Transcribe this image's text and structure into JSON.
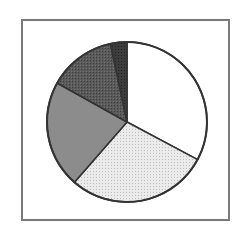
{
  "chart_data": {
    "type": "pie",
    "title": "",
    "categories": [
      "Slice 1",
      "Slice 2",
      "Slice 3",
      "Slice 4",
      "Slice 5"
    ],
    "values": [
      32.8,
      28.6,
      21.7,
      13.6,
      3.3
    ],
    "colors": [
      "#ffffff",
      "#e4e4e4",
      "#8c8c8c",
      "#585858",
      "#3a3a3a"
    ],
    "patterns": [
      "solid",
      "dotted",
      "solid",
      "crosshatch",
      "crosshatch"
    ],
    "start_angle_deg": 0,
    "direction": "clockwise",
    "legend": "none",
    "labels": "none"
  },
  "style": {
    "frame_color": "#7a7a7a",
    "edge_color": "#333333",
    "center": [
      127,
      122
    ],
    "radius": 80
  }
}
